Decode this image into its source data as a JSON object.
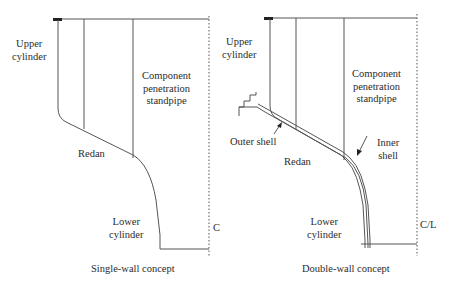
{
  "panels": [
    {
      "id": "single",
      "caption": "Single-wall concept",
      "labels": {
        "upper_cylinder": [
          "Upper",
          "cylinder"
        ],
        "component": [
          "Component",
          "penetration",
          "standpipe"
        ],
        "redan": "Redan",
        "lower_cylinder": [
          "Lower",
          "cylinder"
        ],
        "centerline": "C"
      }
    },
    {
      "id": "double",
      "caption": "Double-wall concept",
      "labels": {
        "upper_cylinder": [
          "Upper",
          "cylinder"
        ],
        "component": [
          "Component",
          "penetration",
          "standpipe"
        ],
        "outer_shell": "Outer shell",
        "inner_shell": [
          "Inner",
          "shell"
        ],
        "redan": "Redan",
        "lower_cylinder": [
          "Lower",
          "cylinder"
        ],
        "centerline": "C/L"
      }
    }
  ],
  "colors": {
    "line": "#555555",
    "text": "#2b2b2b",
    "background": "#ffffff"
  }
}
